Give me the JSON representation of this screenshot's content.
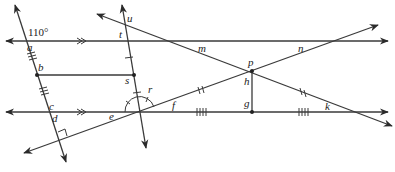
{
  "diagram": {
    "type": "geometry-angles",
    "given_angle": "110°",
    "labels": {
      "a": "a",
      "b": "b",
      "c": "c",
      "d": "d",
      "e": "e",
      "f": "f",
      "g": "g",
      "h": "h",
      "k": "k",
      "m": "m",
      "n": "n",
      "p": "p",
      "r": "r",
      "s": "s",
      "t": "t",
      "u": "u"
    },
    "markings": {
      "parallel_lines": "top horizontal line and bottom horizontal line marked with >>",
      "equal_segments_triple_tick": [
        "a-b",
        "b-c"
      ],
      "equal_segments_single_tick": [
        "t-s",
        "s-(bottom line)"
      ],
      "equal_segments_double_tick": [
        "(e)-p",
        "p-k"
      ],
      "equal_segments_quad_tick": [
        "(e)-g",
        "g-k"
      ],
      "right_angle": "at d between left transversal and lower-left ray",
      "perpendicular": "p-g vertical to bottom line"
    },
    "colors": {
      "line": "#3a3a3a",
      "background": "#ffffff"
    }
  }
}
